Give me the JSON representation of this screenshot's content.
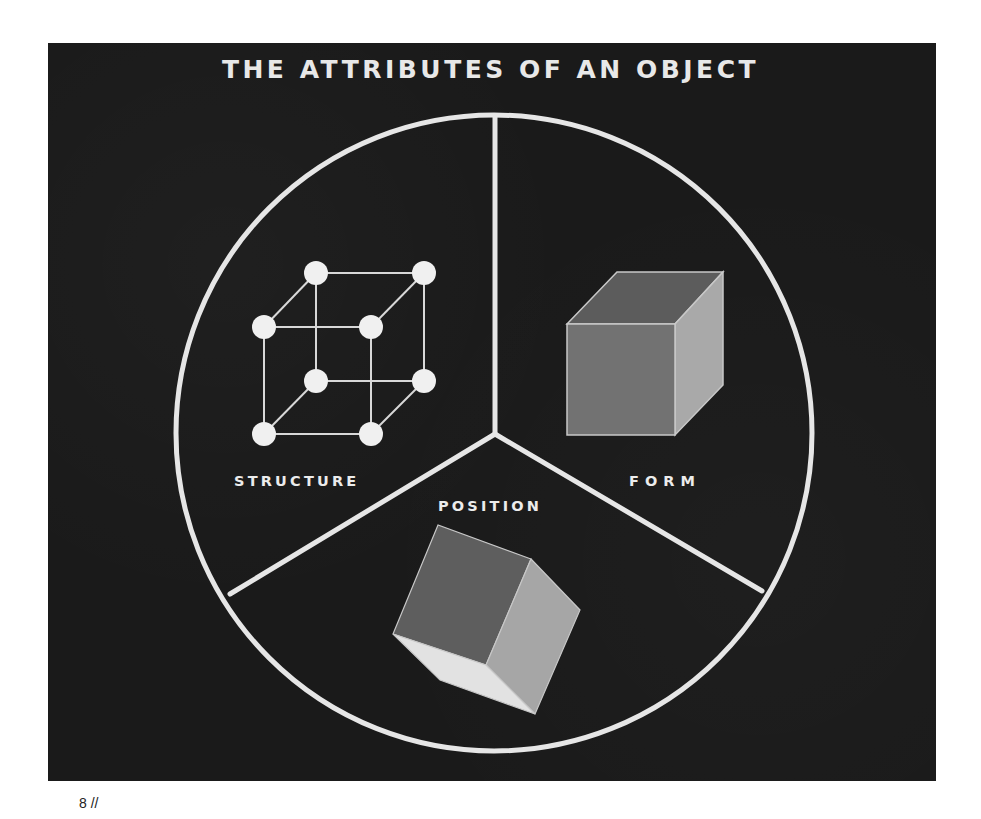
{
  "figure": {
    "title": "THE ATTRIBUTES OF AN OBJECT",
    "sections": [
      {
        "label": "STRUCTURE",
        "illustration": "lattice-cube-icon",
        "description": "wireframe cube with 8 circular nodes at vertices"
      },
      {
        "label": "FORM",
        "illustration": "solid-cube-icon",
        "description": "solid shaded cube in upright position"
      },
      {
        "label": "POSITION",
        "illustration": "tilted-cube-icon",
        "description": "solid shaded cube rotated/tilted"
      }
    ],
    "colors": {
      "background": "#1a1a1a",
      "lines": "#e6e6e6",
      "cube_front": "#6e6e6e",
      "cube_top": "#5a5a5a",
      "cube_side": "#a8a8a8",
      "cube_bottom": "#e0e0e0"
    }
  },
  "footer": {
    "page_number": "8 //"
  }
}
